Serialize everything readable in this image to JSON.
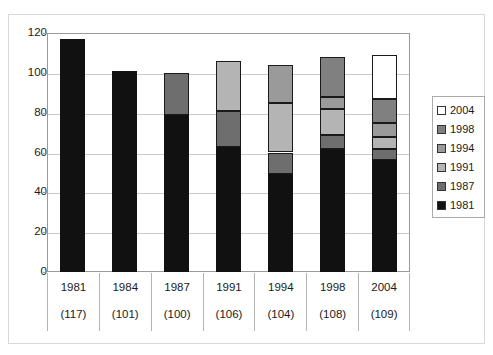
{
  "chart_data": {
    "type": "bar",
    "subtype": "stacked",
    "title": "Cumulative chart",
    "xlabel": "",
    "ylabel": "",
    "ylim": [
      0,
      120
    ],
    "yticks": [
      0,
      20,
      40,
      60,
      80,
      100,
      120
    ],
    "grid": true,
    "legend_position": "right",
    "categories": [
      "1981",
      "1984",
      "1987",
      "1991",
      "1994",
      "1998",
      "2004"
    ],
    "category_counts": [
      "(117)",
      "(101)",
      "(100)",
      "(106)",
      "(104)",
      "(108)",
      "(109)"
    ],
    "series": [
      {
        "name": "1981",
        "color": "#111111",
        "values": [
          117,
          101,
          79,
          63,
          49,
          62,
          56
        ]
      },
      {
        "name": "1987",
        "color": "#6e6e6e",
        "values": [
          0,
          0,
          21,
          18,
          11,
          7,
          6
        ]
      },
      {
        "name": "1991",
        "color": "#b4b4b4",
        "values": [
          0,
          0,
          0,
          25,
          25,
          13,
          6
        ]
      },
      {
        "name": "1994",
        "color": "#9a9a9a",
        "values": [
          0,
          0,
          0,
          0,
          19,
          6,
          7
        ]
      },
      {
        "name": "1998",
        "color": "#808080",
        "values": [
          0,
          0,
          0,
          0,
          0,
          20,
          12
        ]
      },
      {
        "name": "2004",
        "color": "#ffffff",
        "values": [
          0,
          0,
          0,
          0,
          0,
          0,
          22
        ]
      }
    ],
    "totals": [
      117,
      101,
      100,
      106,
      104,
      108,
      109
    ]
  },
  "legend": {
    "entries": [
      {
        "label": "2004",
        "color": "#ffffff"
      },
      {
        "label": "1998",
        "color": "#808080"
      },
      {
        "label": "1994",
        "color": "#9a9a9a"
      },
      {
        "label": "1991",
        "color": "#b4b4b4"
      },
      {
        "label": "1987",
        "color": "#6e6e6e"
      },
      {
        "label": "1981",
        "color": "#111111"
      }
    ]
  },
  "axis": {
    "y_tick_labels": [
      "120",
      "100",
      "80",
      "60",
      "40",
      "20",
      "0"
    ]
  },
  "colors": {
    "frame": "#9a9a9a",
    "grid": "#c9c9c9",
    "outer_border": "#d9d9d9",
    "text": "#1a1a1a"
  }
}
